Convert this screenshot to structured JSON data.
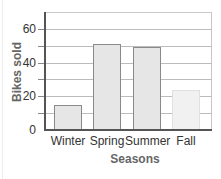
{
  "chart_data": {
    "type": "bar",
    "title": "",
    "xlabel": "Seasons",
    "ylabel": "Bikes sold",
    "categories": [
      "Winter",
      "Spring",
      "Summer",
      "Fall"
    ],
    "values": [
      15,
      51,
      49,
      24
    ],
    "ylim": [
      0,
      70
    ],
    "yticks": [
      0,
      20,
      40,
      60
    ],
    "yticks_labels": [
      "0",
      "20",
      "40",
      "60"
    ],
    "grid": true,
    "grid_step": 10,
    "legend": null,
    "bar_colors": [
      "#e6e6e6",
      "#e6e6e6",
      "#e6e6e6",
      "#f1f1f1"
    ]
  },
  "axis": {
    "xlabel": "Seasons",
    "ylabel": "Bikes sold",
    "ytick_labels": [
      "0",
      "20",
      "40",
      "60"
    ],
    "xtick_labels": [
      "Winter",
      "Spring",
      "Summer",
      "Fall"
    ]
  }
}
